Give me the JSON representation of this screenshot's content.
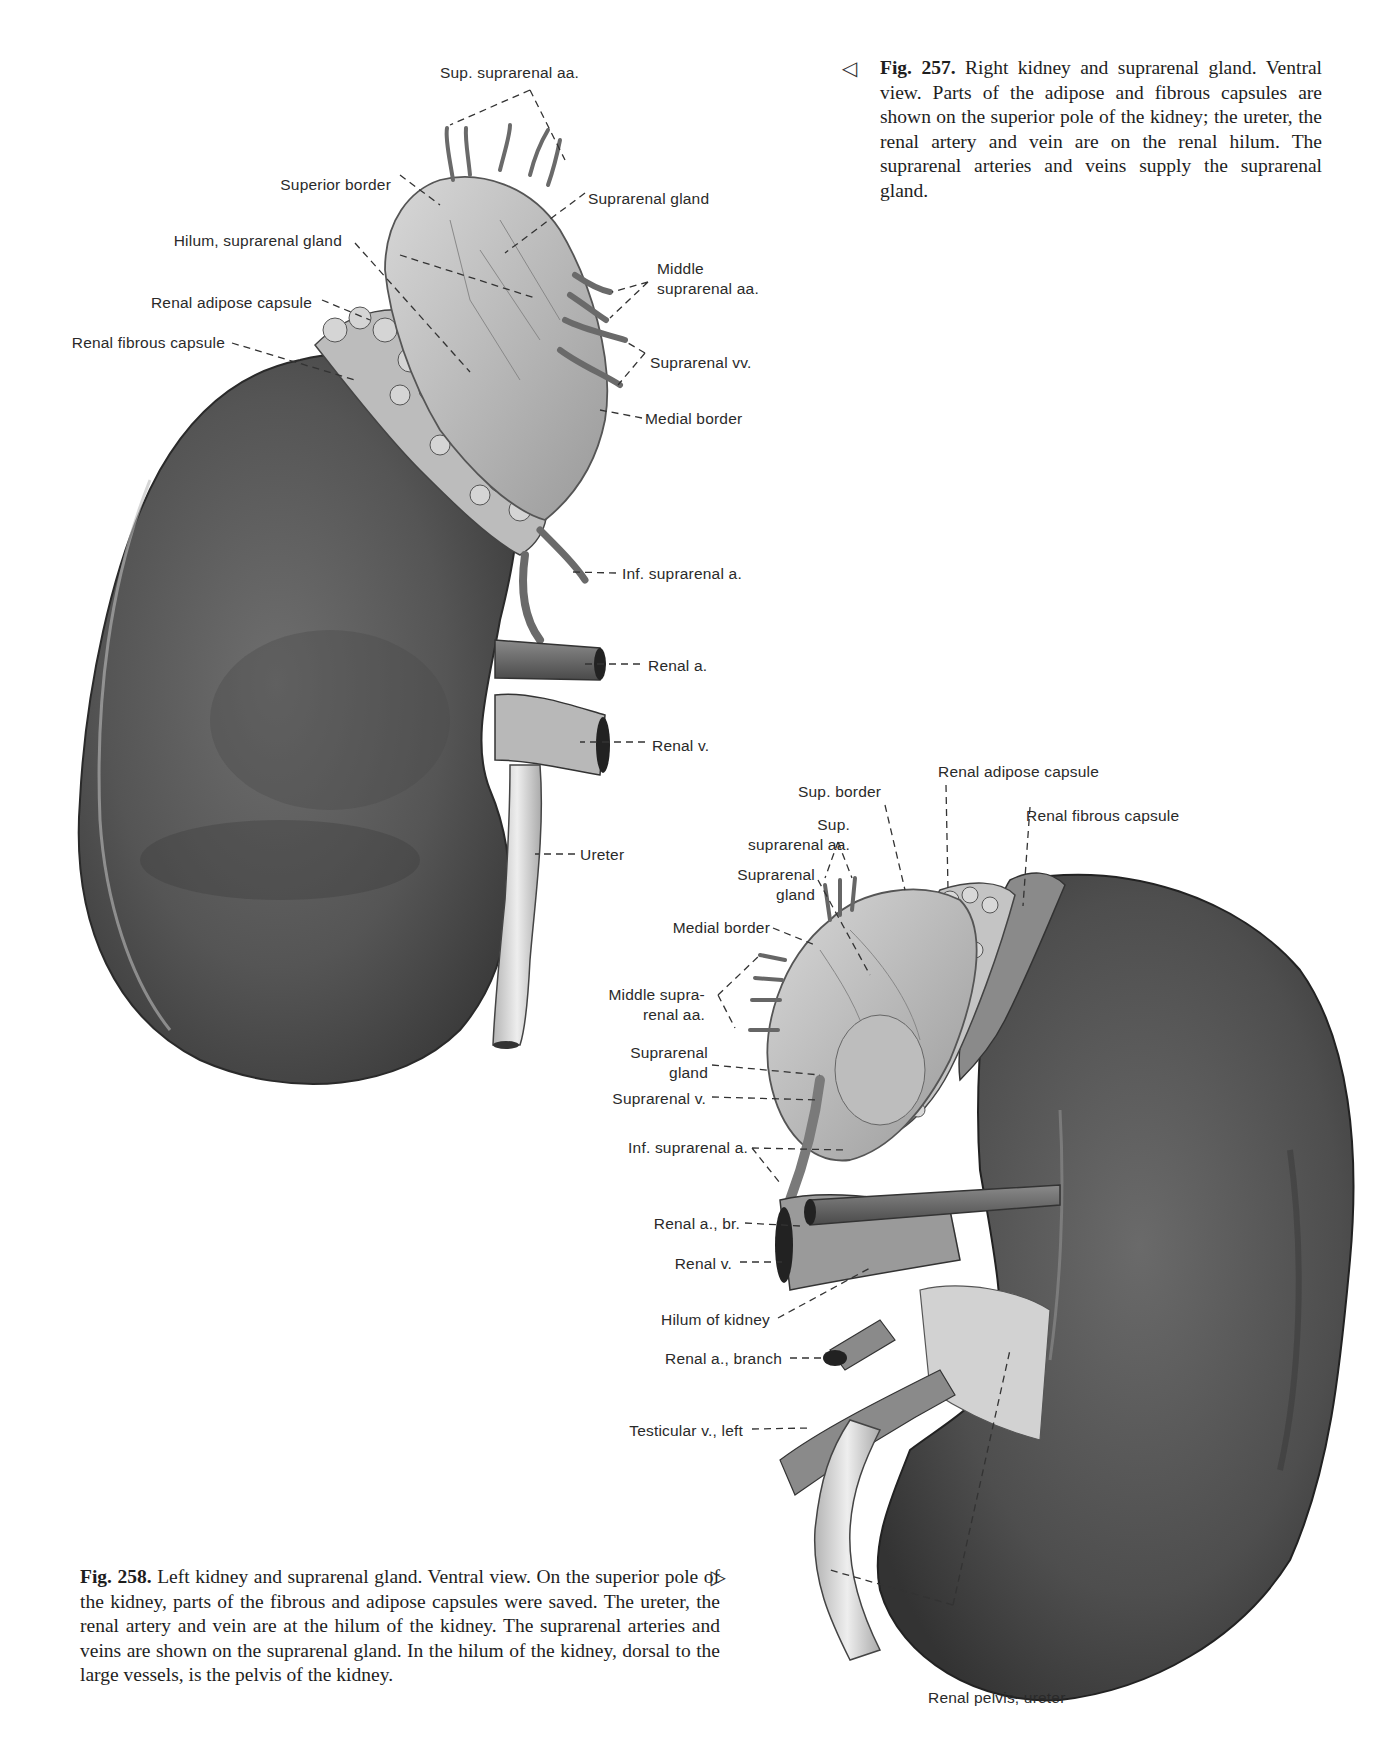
{
  "figures": [
    {
      "id": "fig257",
      "number": "Fig. 257.",
      "caption": "Right kidney and suprarenal gland. Ventral view. Parts of the adipose and fibrous capsules are shown on the superior pole of the kidney; the ureter, the renal artery and vein are on the renal hilum. The suprarenal arteries and veins supply the suprarenal gland.",
      "pointer_icon": "◁",
      "labels": [
        "Sup. suprarenal aa.",
        "Superior border",
        "Suprarenal gland",
        "Hilum, suprarenal gland",
        "Middle",
        "suprarenal aa.",
        "Renal adipose capsule",
        "Renal fibrous capsule",
        "Suprarenal vv.",
        "Medial border",
        "Inf. suprarenal a.",
        "Renal a.",
        "Renal v.",
        "Ureter"
      ]
    },
    {
      "id": "fig258",
      "number": "Fig. 258.",
      "caption": "Left kidney and suprarenal gland. Ventral view. On the superior pole of the kidney, parts of the fibrous and adipose capsules were saved. The ureter, the renal artery and vein are at the hilum of the kidney. The suprarenal arteries and veins are shown on the suprarenal gland. In the hilum of the kidney, dorsal to the large vessels, is the pelvis of the kidney.",
      "pointer_icon": "▷",
      "labels": [
        "Renal adipose capsule",
        "Sup. border",
        "Renal fibrous capsule",
        "Sup.",
        "suprarenal aa.",
        "Suprarenal",
        "gland",
        "Medial border",
        "Middle supra-",
        "renal aa.",
        "Suprarenal",
        "gland",
        "Suprarenal v.",
        "Inf. suprarenal a.",
        "Renal a., br.",
        "Renal v.",
        "Hilum of kidney",
        "Renal a., branch",
        "Testicular v., left",
        "Renal pelvis, ureter"
      ]
    }
  ]
}
